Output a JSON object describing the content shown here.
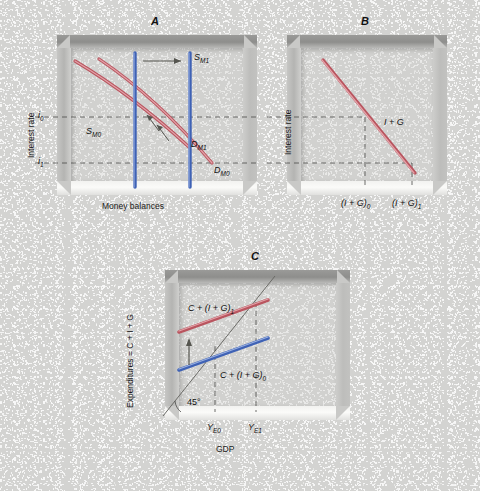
{
  "figure": {
    "background_color": "#d3d3d1",
    "curve_color_red": "#c4656e",
    "curve_color_blue": "#5b7fc7",
    "dash_color": "#4a4a48"
  },
  "panels": [
    {
      "id": "A",
      "letter": "A",
      "y_axis_label": "Interest rate",
      "x_axis_label": "Money balances",
      "y_ticks": [
        "i0",
        "i1"
      ],
      "y_tick_display": [
        "i",
        "i"
      ],
      "y_tick_sub": [
        "0",
        "1"
      ],
      "curves": [
        {
          "name": "supply-money-0",
          "label_base": "S",
          "label_sub": "M0",
          "color": "#5b7fc7",
          "type": "vertical"
        },
        {
          "name": "supply-money-1",
          "label_base": "S",
          "label_sub": "M1",
          "color": "#5b7fc7",
          "type": "vertical"
        },
        {
          "name": "demand-money-0",
          "label_base": "D",
          "label_sub": "M0",
          "color": "#c4656e",
          "type": "downward"
        },
        {
          "name": "demand-money-1",
          "label_base": "D",
          "label_sub": "M1",
          "color": "#c4656e",
          "type": "downward"
        }
      ],
      "labels": {
        "s_m0": "S",
        "s_m0_sub": "M0",
        "s_m1": "S",
        "s_m1_sub": "M1",
        "d_m0": "D",
        "d_m0_sub": "M0",
        "d_m1": "D",
        "d_m1_sub": "M1",
        "i0": "i",
        "i0_sub": "0",
        "i1": "i",
        "i1_sub": "1"
      },
      "arrows": [
        "money-supply-shift-right",
        "money-demand-shift-left"
      ]
    },
    {
      "id": "B",
      "letter": "B",
      "y_axis_label": "Interest rate",
      "x_axis_label": "",
      "curves": [
        {
          "name": "investment-government-demand",
          "label": "I + G",
          "color": "#c4656e",
          "type": "downward"
        }
      ],
      "labels": {
        "ig_curve": "I + G",
        "ig0": "(I + G)",
        "ig0_sub": "0",
        "ig1": "(I + G)",
        "ig1_sub": "1"
      }
    },
    {
      "id": "C",
      "letter": "C",
      "y_axis_label": "Expenditures = C + I + G",
      "x_axis_label": "GDP",
      "curves": [
        {
          "name": "aggregate-expenditure-1",
          "label": "C + (I + G)",
          "label_sub": "1",
          "color": "#c4656e",
          "type": "upward"
        },
        {
          "name": "aggregate-expenditure-0",
          "label": "C + (I + G)",
          "label_sub": "0",
          "color": "#5b7fc7",
          "type": "upward"
        },
        {
          "name": "forty-five-degree-line",
          "label": "45°",
          "color": "#5a5a58",
          "type": "reference"
        }
      ],
      "labels": {
        "ae1": "C + (I + G)",
        "ae1_sub": "1",
        "ae0": "C + (I + G)",
        "ae0_sub": "0",
        "angle": "45°",
        "ye0": "Y",
        "ye0_sub": "E0",
        "ye1": "Y",
        "ye1_sub": "E1",
        "gdp": "GDP"
      },
      "arrows": [
        "expenditure-shift-up"
      ]
    }
  ]
}
